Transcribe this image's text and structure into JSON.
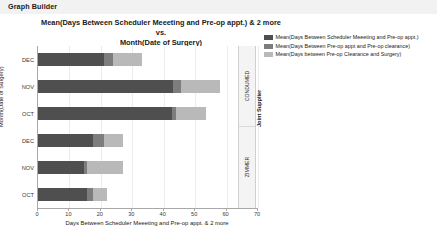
{
  "window": {
    "title": "Graph Builder"
  },
  "chart_data": {
    "type": "bar",
    "orientation": "horizontal",
    "stacked": true,
    "title": "Mean(Days Between Scheduler Meeeting and Pre-op appt.) & 2 more vs. Month(Date of Surgery)",
    "title_line1": "Mean(Days Between Scheduler Meeeting and Pre-op appt.) & 2 more vs.",
    "title_line2": "Month(Date of Surgery)",
    "xlabel": "Days Between Scheduler Meeeting and Pre-op appt. & 2 more",
    "ylabel": "Month(Date of Surgery)",
    "group_axis_label": "Joint Supplier",
    "xlim": [
      0,
      70
    ],
    "xticks": [
      0,
      10,
      20,
      30,
      40,
      50,
      60,
      70
    ],
    "xtick_labels": [
      "0",
      "10",
      "20",
      "30",
      "40",
      "50",
      "60",
      "70"
    ],
    "grid": true,
    "legend_position": "right",
    "series": [
      {
        "name": "Mean(Days Between Scheduler Meeeting and Pre-op appt.)",
        "color": "#4f4f4f",
        "values": [
          21.0,
          43.0,
          42.5,
          17.5,
          14.5,
          15.5
        ]
      },
      {
        "name": "Mean(Days Between Pre-op appt and Pre-op clearance)",
        "color": "#7d7d7d",
        "values": [
          3.0,
          2.5,
          1.5,
          3.5,
          1.0,
          2.0
        ]
      },
      {
        "name": "Mean(Days between Pre-op Clearance and Surgery)",
        "color": "#b9b9b9",
        "values": [
          9.0,
          12.5,
          9.5,
          6.0,
          11.5,
          4.5
        ]
      }
    ],
    "groups": [
      {
        "label": "CONDUMED",
        "categories": [
          "DEC",
          "NOV",
          "OCT"
        ]
      },
      {
        "label": "ZIMMER",
        "categories": [
          "DEC",
          "NOV",
          "OCT"
        ]
      }
    ],
    "categories": [
      "DEC",
      "NOV",
      "OCT",
      "DEC",
      "NOV",
      "OCT"
    ],
    "bars": [
      {
        "group": "CONDUMED",
        "category": "DEC",
        "segments": [
          21.0,
          3.0,
          9.0
        ],
        "total": 33.0
      },
      {
        "group": "CONDUMED",
        "category": "NOV",
        "segments": [
          43.0,
          2.5,
          12.5
        ],
        "total": 58.0
      },
      {
        "group": "CONDUMED",
        "category": "OCT",
        "segments": [
          42.5,
          1.5,
          9.5
        ],
        "total": 53.5
      },
      {
        "group": "ZIMMER",
        "category": "DEC",
        "segments": [
          17.5,
          3.5,
          6.0
        ],
        "total": 27.0
      },
      {
        "group": "ZIMMER",
        "category": "NOV",
        "segments": [
          14.5,
          1.0,
          11.5
        ],
        "total": 27.0
      },
      {
        "group": "ZIMMER",
        "category": "OCT",
        "segments": [
          15.5,
          2.0,
          4.5
        ],
        "total": 22.0
      }
    ]
  }
}
